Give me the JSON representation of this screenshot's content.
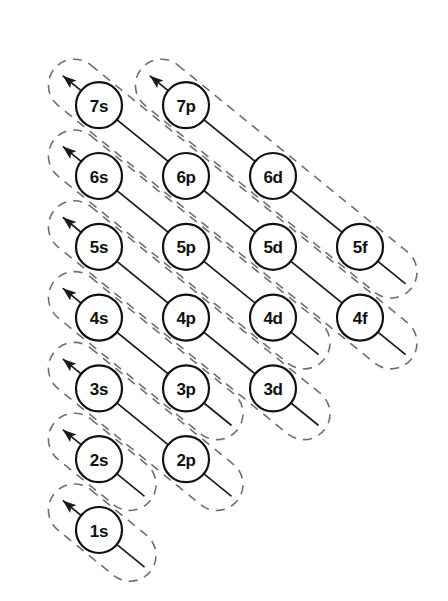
{
  "diagram": {
    "type": "diagram",
    "background_color": "#ffffff",
    "circle_stroke_color": "#111111",
    "arrow_color": "#1a1a1a",
    "dashed_guide_color": "#6f6f6f",
    "circle_radius": 23,
    "column_spacing": 87,
    "row_spacing": 70.8,
    "origin": {
      "x": 99,
      "y": 530
    }
  },
  "columns": [
    {
      "key": "s",
      "label": "s",
      "index": 0
    },
    {
      "key": "p",
      "label": "p",
      "index": 1
    },
    {
      "key": "d",
      "label": "d",
      "index": 2
    },
    {
      "key": "f",
      "label": "f",
      "index": 3
    }
  ],
  "rows": [
    {
      "n": 7,
      "index": 6
    },
    {
      "n": 6,
      "index": 5
    },
    {
      "n": 5,
      "index": 4
    },
    {
      "n": 4,
      "index": 3
    },
    {
      "n": 3,
      "index": 2
    },
    {
      "n": 2,
      "index": 1
    },
    {
      "n": 1,
      "index": 0
    }
  ],
  "orbitals": [
    {
      "label": "7s",
      "n": 7,
      "sub": "s",
      "col": 0,
      "row": 6
    },
    {
      "label": "7p",
      "n": 7,
      "sub": "p",
      "col": 1,
      "row": 6
    },
    {
      "label": "6s",
      "n": 6,
      "sub": "s",
      "col": 0,
      "row": 5
    },
    {
      "label": "6p",
      "n": 6,
      "sub": "p",
      "col": 1,
      "row": 5
    },
    {
      "label": "6d",
      "n": 6,
      "sub": "d",
      "col": 2,
      "row": 5
    },
    {
      "label": "5s",
      "n": 5,
      "sub": "s",
      "col": 0,
      "row": 4
    },
    {
      "label": "5p",
      "n": 5,
      "sub": "p",
      "col": 1,
      "row": 4
    },
    {
      "label": "5d",
      "n": 5,
      "sub": "d",
      "col": 2,
      "row": 4
    },
    {
      "label": "5f",
      "n": 5,
      "sub": "f",
      "col": 3,
      "row": 4
    },
    {
      "label": "4s",
      "n": 4,
      "sub": "s",
      "col": 0,
      "row": 3
    },
    {
      "label": "4p",
      "n": 4,
      "sub": "p",
      "col": 1,
      "row": 3
    },
    {
      "label": "4d",
      "n": 4,
      "sub": "d",
      "col": 2,
      "row": 3
    },
    {
      "label": "4f",
      "n": 4,
      "sub": "f",
      "col": 3,
      "row": 3
    },
    {
      "label": "3s",
      "n": 3,
      "sub": "s",
      "col": 0,
      "row": 2
    },
    {
      "label": "3p",
      "n": 3,
      "sub": "p",
      "col": 1,
      "row": 2
    },
    {
      "label": "3d",
      "n": 3,
      "sub": "d",
      "col": 2,
      "row": 2
    },
    {
      "label": "2s",
      "n": 2,
      "sub": "s",
      "col": 0,
      "row": 1
    },
    {
      "label": "2p",
      "n": 2,
      "sub": "p",
      "col": 1,
      "row": 1
    },
    {
      "label": "1s",
      "n": 1,
      "sub": "s",
      "col": 0,
      "row": 0
    }
  ],
  "diagonals": [
    {
      "id": "d1",
      "members": [
        "1s"
      ],
      "direction": "up-left",
      "has_arrowhead": true,
      "has_dashed_capsule": true
    },
    {
      "id": "d2",
      "members": [
        "2s"
      ],
      "direction": "up-left",
      "has_arrowhead": true,
      "has_dashed_capsule": true
    },
    {
      "id": "d3",
      "members": [
        "2p",
        "3s"
      ],
      "direction": "up-left",
      "has_arrowhead": true,
      "has_dashed_capsule": true
    },
    {
      "id": "d4",
      "members": [
        "3p",
        "4s"
      ],
      "direction": "up-left",
      "has_arrowhead": true,
      "has_dashed_capsule": true
    },
    {
      "id": "d5",
      "members": [
        "3d",
        "4p",
        "5s"
      ],
      "direction": "up-left",
      "has_arrowhead": true,
      "has_dashed_capsule": true
    },
    {
      "id": "d6",
      "members": [
        "4d",
        "5p",
        "6s"
      ],
      "direction": "up-left",
      "has_arrowhead": true,
      "has_dashed_capsule": true
    },
    {
      "id": "d7",
      "members": [
        "4f",
        "5d",
        "6p",
        "7s"
      ],
      "direction": "up-left",
      "has_arrowhead": true,
      "has_dashed_capsule": true
    },
    {
      "id": "d8",
      "members": [
        "5f",
        "6d",
        "7p"
      ],
      "direction": "up-left",
      "has_arrowhead": true,
      "has_dashed_capsule": true
    }
  ],
  "filling_order": [
    "1s",
    "2s",
    "2p",
    "3s",
    "3p",
    "4s",
    "3d",
    "4p",
    "5s",
    "4d",
    "5p",
    "6s",
    "4f",
    "5d",
    "6p",
    "7s",
    "5f",
    "6d",
    "7p"
  ]
}
